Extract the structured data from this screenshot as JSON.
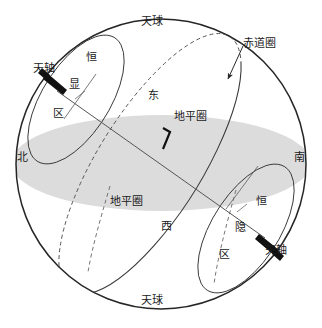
{
  "figure": {
    "title_top": "天球",
    "title_bottom": "天球",
    "type": "celestial-sphere-diagram",
    "background_color": "#ffffff",
    "line_color": "#3a3a3a",
    "sphere_outline_color": "#262626",
    "horizon_fill_color": "#dcdcdc",
    "text_color": "#1a1a1a"
  },
  "labels": {
    "celestial_sphere_top": "天球",
    "celestial_sphere_bottom": "天球",
    "celestial_axis_upper": "天轴",
    "celestial_axis_lower": "天轴",
    "equator_circle": "赤道圈",
    "horizon_circle_upper": "地平圈",
    "horizon_circle_lower": "地平圈",
    "north": "北",
    "south": "南",
    "east": "东",
    "west": "西",
    "circumpolar_visible_1": "恒",
    "circumpolar_visible_2": "显",
    "circumpolar_visible_3": "区",
    "circumpolar_hidden_1": "恒",
    "circumpolar_hidden_2": "隐",
    "circumpolar_hidden_3": "区"
  },
  "annotations": {
    "right_angle_marker": "⌐",
    "equator_leader_arrow": "arrow-down-left",
    "axis_arrow_upper": "arrow-up-left",
    "axis_arrow_lower": "arrow-down-right"
  }
}
